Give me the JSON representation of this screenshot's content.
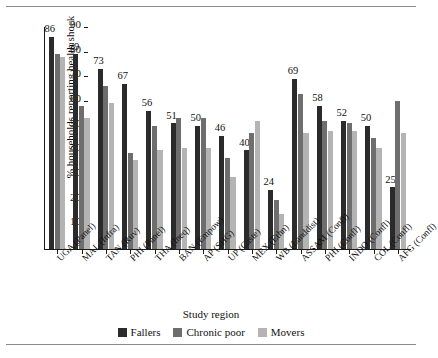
{
  "chart_data": {
    "type": "bar",
    "title": "",
    "xlabel": "Study region",
    "ylabel": "% households reporting health shock",
    "ylim": [
      0,
      90
    ],
    "yticks": [
      0,
      10,
      20,
      30,
      40,
      50,
      60,
      70,
      80,
      90
    ],
    "grid": false,
    "legend_position": "bottom",
    "categories": [
      "UGA (Panel)",
      "MAL (Infra)",
      "TAN (Ruv)",
      "PHI (Panel)",
      "THA (Ineq)",
      "BAN (Empow)",
      "AP (SHG)",
      "UP (Caste)",
      "MEX (Ethn)",
      "WB (Landdist)",
      "ASSAM (Confl)",
      "PHI (Confl)",
      "INDO (Confl)",
      "COL (Confl)",
      "AFG (Confl)"
    ],
    "series": [
      {
        "name": "Fallers",
        "color": "#2b2b2b",
        "values": [
          86,
          79,
          73,
          67,
          56,
          51,
          50,
          46,
          40,
          24,
          69,
          58,
          52,
          50,
          25
        ],
        "labels": [
          "86",
          "79",
          "73",
          "67",
          "56",
          "51",
          "50",
          "46",
          "40",
          "24",
          "69",
          "58",
          "52",
          "50",
          "25"
        ]
      },
      {
        "name": "Chronic poor",
        "color": "#6e6e6e",
        "values": [
          79,
          58,
          66,
          39,
          50,
          53,
          53,
          37,
          47,
          20,
          63,
          52,
          51,
          45,
          60
        ],
        "labels": [
          "",
          "",
          "",
          "",
          "",
          "",
          "",
          "",
          "",
          "",
          "",
          "",
          "",
          "",
          ""
        ]
      },
      {
        "name": "Movers",
        "color": "#b4b4b4",
        "values": [
          78,
          53,
          59,
          36,
          40,
          41,
          41,
          29,
          52,
          14,
          47,
          48,
          48,
          41,
          47
        ],
        "labels": [
          "",
          "",
          "",
          "",
          "",
          "",
          "",
          "",
          "",
          "",
          "",
          "",
          "",
          "",
          ""
        ]
      }
    ]
  },
  "legend": {
    "items": [
      {
        "label": "Fallers",
        "color": "#2b2b2b"
      },
      {
        "label": "Chronic poor",
        "color": "#6e6e6e"
      },
      {
        "label": "Movers",
        "color": "#b4b4b4"
      }
    ]
  }
}
